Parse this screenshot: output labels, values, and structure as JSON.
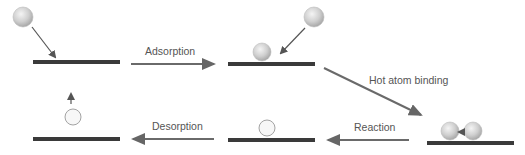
{
  "diagram": {
    "labels": {
      "adsorption": "Adsorption",
      "hot_atom_binding": "Hot atom binding",
      "reaction": "Reaction",
      "desorption": "Desorption"
    },
    "colors": {
      "surface": "#3a3a3a",
      "arrow": "#6a6a6a",
      "atom_fill": "#d8d8d8",
      "atom_stroke": "#aaaaaa",
      "product_fill": "#f7f7f7",
      "product_stroke": "#999999"
    },
    "stages": [
      {
        "name": "incoming-atom",
        "description": "Gas atom approaching surface"
      },
      {
        "name": "adsorbed-atom",
        "description": "Atom adsorbed on surface, second atom approaching"
      },
      {
        "name": "hot-atom-binding",
        "description": "Two atoms binding on surface"
      },
      {
        "name": "reaction",
        "description": "Product molecule on surface"
      },
      {
        "name": "desorption",
        "description": "Product desorbing from surface"
      }
    ]
  }
}
